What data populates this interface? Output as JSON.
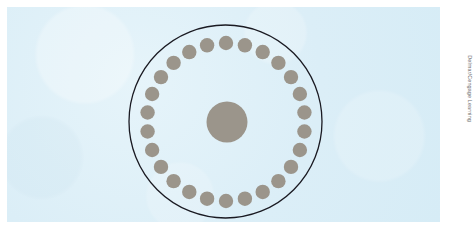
{
  "figure": {
    "name": "circular-cross-section-diagram",
    "background_color": "#ffffff",
    "panel_color": "#ddeff7",
    "panel": {
      "x": 7,
      "y": 7,
      "width": 433,
      "height": 215
    }
  },
  "credit": {
    "text": "Delmar/Cengage Learning"
  },
  "chart_data": {
    "type": "scatter",
    "title": "",
    "subtitle": "",
    "xlabel": "",
    "ylabel": "",
    "grid": false,
    "legend": null,
    "xlim": [
      0,
      468
    ],
    "ylim": [
      0,
      240
    ],
    "outer_circle": {
      "label": "outer-boundary-circle",
      "cx": 225.5,
      "cy": 121.5,
      "r": 96.5,
      "fill": "none",
      "stroke": "#1a1a22",
      "stroke_width": 1.3
    },
    "center_circle": {
      "label": "central-core-circle",
      "cx": 227,
      "cy": 122,
      "r": 20.5,
      "fill": "#9b958b",
      "stroke": "none"
    },
    "ring": {
      "label": "peripheral-dot-ring",
      "count": 26,
      "ring_radius": 79,
      "dot_radius": 7.2,
      "dot_fill": "#9b958b",
      "start_angle_deg": -90,
      "cx": 226,
      "cy": 122,
      "angles_deg": [
        -90,
        -76.15,
        -62.31,
        -48.46,
        -34.62,
        -20.77,
        -6.92,
        6.92,
        20.77,
        34.62,
        48.46,
        62.31,
        76.15,
        90,
        103.85,
        117.69,
        131.54,
        145.38,
        159.23,
        173.08,
        186.92,
        200.77,
        214.62,
        228.46,
        242.31,
        256.15
      ]
    }
  }
}
